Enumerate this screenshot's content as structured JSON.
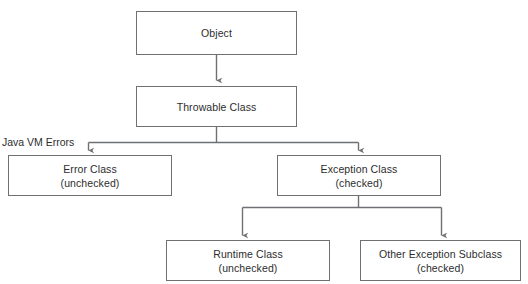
{
  "diagram": {
    "type": "flowchart",
    "background_color": "#ffffff",
    "box_border_color": "#6e7073",
    "text_color": "#2d2d2d",
    "edge_color": "#6e7073",
    "nodes": [
      {
        "id": "object",
        "label": "Object",
        "sublabel": "",
        "x": 136,
        "y": 11,
        "w": 161,
        "h": 44
      },
      {
        "id": "throwable",
        "label": "Throwable Class",
        "sublabel": "",
        "x": 136,
        "y": 86,
        "w": 161,
        "h": 41
      },
      {
        "id": "error",
        "label": "Error Class",
        "sublabel": "(unchecked)",
        "x": 8,
        "y": 155,
        "w": 164,
        "h": 41
      },
      {
        "id": "exception",
        "label": "Exception Class",
        "sublabel": "(checked)",
        "x": 277,
        "y": 155,
        "w": 164,
        "h": 41
      },
      {
        "id": "runtime",
        "label": "Runtime Class",
        "sublabel": "(unchecked)",
        "x": 166,
        "y": 240,
        "w": 164,
        "h": 41
      },
      {
        "id": "other-exception",
        "label": "Other Exception Subclass",
        "sublabel": "(checked)",
        "x": 360,
        "y": 240,
        "w": 161,
        "h": 41
      }
    ],
    "edge_labels": [
      {
        "id": "java-vm-errors",
        "text": "Java VM Errors",
        "x": 2,
        "y": 136
      }
    ],
    "edges": [
      {
        "id": "object-to-throwable",
        "from": "object",
        "to": "throwable",
        "style": "straight-arrow"
      },
      {
        "id": "throwable-to-error",
        "from": "throwable",
        "to": "error",
        "style": "elbow-arrow"
      },
      {
        "id": "throwable-to-exception",
        "from": "throwable",
        "to": "exception",
        "style": "elbow-arrow"
      },
      {
        "id": "exception-to-runtime",
        "from": "exception",
        "to": "runtime",
        "style": "elbow-arrow"
      },
      {
        "id": "exception-to-other",
        "from": "exception",
        "to": "other-exception",
        "style": "elbow-arrow"
      }
    ]
  }
}
